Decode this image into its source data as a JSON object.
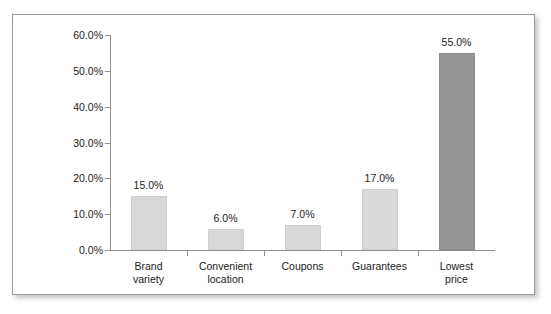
{
  "chart_data": {
    "type": "bar",
    "title": "",
    "xlabel": "",
    "ylabel": "",
    "categories": [
      "Brand variety",
      "Convenient location",
      "Coupons",
      "Guarantees",
      "Lowest price"
    ],
    "category_lines": [
      [
        "Brand",
        "variety"
      ],
      [
        "Convenient",
        "location"
      ],
      [
        "Coupons",
        ""
      ],
      [
        "Guarantees",
        ""
      ],
      [
        "Lowest",
        "price"
      ]
    ],
    "values": [
      15.0,
      6.0,
      7.0,
      17.0,
      55.0
    ],
    "value_labels": [
      "15.0%",
      "6.0%",
      "7.0%",
      "17.0%",
      "55.0%"
    ],
    "ylim": [
      0,
      60
    ],
    "ytick_values": [
      0,
      10,
      20,
      30,
      40,
      50,
      60
    ],
    "ytick_labels": [
      "0.0%",
      "10.0%",
      "20.0%",
      "30.0%",
      "40.0%",
      "50.0%",
      "60.0%"
    ],
    "grid": false,
    "legend": null,
    "bar_colors": [
      "#d9d9d9",
      "#d9d9d9",
      "#d9d9d9",
      "#d9d9d9",
      "#969696"
    ],
    "highlight_index": 4,
    "colors": {
      "bar_light": "#d9d9d9",
      "bar_dark": "#969696",
      "axis": "#8f8f8f",
      "text": "#1c1c1c",
      "frame": "#9a9a9a",
      "background": "#ffffff"
    }
  }
}
